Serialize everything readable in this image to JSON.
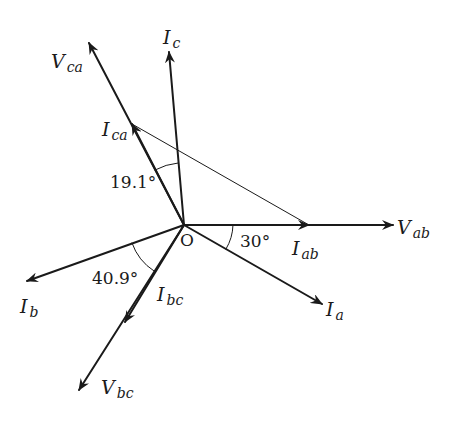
{
  "diagram": {
    "type": "phasor-diagram",
    "origin": {
      "label": "O",
      "x": 184,
      "y": 225
    },
    "colors": {
      "stroke": "#1a1a1a",
      "background": "#ffffff"
    },
    "phasors": [
      {
        "id": "vab",
        "symbol": "V",
        "subscript": "ab",
        "tip": [
          393,
          225
        ],
        "weight": "bold"
      },
      {
        "id": "iab",
        "symbol": "I",
        "subscript": "ab",
        "tip": [
          309,
          225
        ],
        "weight": "bold"
      },
      {
        "id": "ia",
        "symbol": "I",
        "subscript": "a",
        "tip": [
          322,
          304
        ],
        "weight": "bold"
      },
      {
        "id": "vca",
        "symbol": "V",
        "subscript": "ca",
        "tip": [
          89,
          43
        ],
        "weight": "bold"
      },
      {
        "id": "ica",
        "symbol": "I",
        "subscript": "ca",
        "tip": [
          132,
          124
        ],
        "weight": "bold"
      },
      {
        "id": "ic",
        "symbol": "I",
        "subscript": "c",
        "tip": [
          169,
          52
        ],
        "weight": "bold"
      },
      {
        "id": "ib",
        "symbol": "I",
        "subscript": "b",
        "tip": [
          27,
          281
        ],
        "weight": "bold"
      },
      {
        "id": "ibc",
        "symbol": "I",
        "subscript": "bc",
        "tip": [
          125,
          322
        ],
        "weight": "bold"
      },
      {
        "id": "vbc",
        "symbol": "V",
        "subscript": "bc",
        "tip": [
          79,
          390
        ],
        "weight": "bold"
      }
    ],
    "construction_line": {
      "from": [
        132,
        124
      ],
      "to": [
        309,
        225
      ]
    },
    "angles": [
      {
        "label": "30°",
        "value": 30,
        "between": [
          "iab",
          "ia"
        ]
      },
      {
        "label": "19.1°",
        "value": 19.1,
        "between": [
          "ica",
          "ic"
        ]
      },
      {
        "label": "40.9°",
        "value": 40.9,
        "between": [
          "ib",
          "ibc"
        ]
      }
    ]
  },
  "labels": {
    "origin": "O",
    "vab": {
      "sym": "V",
      "sub": "ab"
    },
    "iab": {
      "sym": "I",
      "sub": "ab"
    },
    "ia": {
      "sym": "I",
      "sub": "a"
    },
    "vca": {
      "sym": "V",
      "sub": "ca"
    },
    "ica": {
      "sym": "I",
      "sub": "ca"
    },
    "ic": {
      "sym": "I",
      "sub": "c"
    },
    "ib": {
      "sym": "I",
      "sub": "b"
    },
    "ibc": {
      "sym": "I",
      "sub": "bc"
    },
    "vbc": {
      "sym": "V",
      "sub": "bc"
    },
    "angle_30": "30°",
    "angle_19": "19.1°",
    "angle_40": "40.9°"
  }
}
